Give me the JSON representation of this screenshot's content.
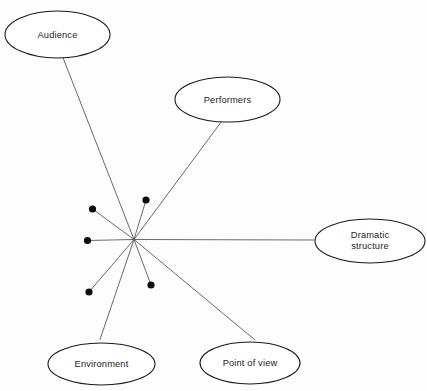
{
  "diagram": {
    "type": "radial-spoke-diagram",
    "title": "",
    "canvas": {
      "width": 427,
      "height": 391,
      "background": "#fdfdfd"
    },
    "style": {
      "node_stroke": "#1b1b1b",
      "node_fill": "#ffffff",
      "line_color": "#59595c",
      "dot_color": "#0b0b0b",
      "text_color": "#242424"
    },
    "hub": {
      "x": 134,
      "y": 239.5,
      "label": ""
    },
    "nodes": [
      {
        "id": "audience",
        "label": "Audience",
        "cx": 57.5,
        "cy": 34.5,
        "rx": 52.5,
        "ry": 23.5,
        "anchor_x": 61,
        "anchor_y": 52.5
      },
      {
        "id": "performers",
        "label": "Performers",
        "cx": 227.5,
        "cy": 99.5,
        "rx": 52.5,
        "ry": 22.5,
        "anchor_x": 223,
        "anchor_y": 119.5
      },
      {
        "id": "dramatic-structure",
        "label": "Dramatic\nstructure",
        "cx": 370,
        "cy": 241,
        "rx": 55,
        "ry": 22,
        "anchor_x": 314,
        "anchor_y": 240
      },
      {
        "id": "point-of-view",
        "label": "Point of view",
        "cx": 250,
        "cy": 363,
        "rx": 50,
        "ry": 21,
        "anchor_x": 255,
        "anchor_y": 340
      },
      {
        "id": "environment",
        "label": "Environment",
        "cx": 101.5,
        "cy": 364,
        "rx": 53.5,
        "ry": 21,
        "anchor_x": 100,
        "anchor_y": 339.5
      }
    ],
    "stubs": [
      {
        "id": "stub-upper-left",
        "x": 92.5,
        "y": 209,
        "r": 3.6
      },
      {
        "id": "stub-upper-right",
        "x": 146,
        "y": 200,
        "r": 3.6
      },
      {
        "id": "stub-left",
        "x": 87.5,
        "y": 240.5,
        "r": 3.6
      },
      {
        "id": "stub-lower-left",
        "x": 89,
        "y": 292,
        "r": 3.6
      },
      {
        "id": "stub-lower-right",
        "x": 151,
        "y": 285,
        "r": 3.6
      }
    ]
  }
}
